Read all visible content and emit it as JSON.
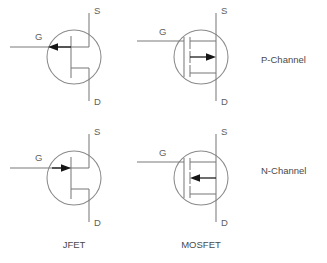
{
  "diagram": {
    "background_color": "#ffffff",
    "wire_color": "#7b7b7b",
    "arrow_color": "#151515",
    "text_color": "#4a4a4a",
    "columns": [
      {
        "key": "jfet",
        "label": "JFET"
      },
      {
        "key": "mosfet",
        "label": "MOSFET"
      }
    ],
    "rows": [
      {
        "key": "p_channel",
        "label": "P-Channel"
      },
      {
        "key": "n_channel",
        "label": "N-Channel"
      }
    ],
    "terminals": {
      "source": "S",
      "drain": "D",
      "gate": "G"
    },
    "symbols": [
      {
        "key": "p-channel-jfet",
        "device": "JFET",
        "channel": "P-Channel",
        "gate_arrow_direction": "left",
        "terminal_source": "S",
        "terminal_drain": "D",
        "terminal_gate": "G"
      },
      {
        "key": "p-channel-mosfet",
        "device": "MOSFET",
        "channel": "P-Channel",
        "gate_arrow_direction": "right",
        "terminal_source": "S",
        "terminal_drain": "D",
        "terminal_gate": "G"
      },
      {
        "key": "n-channel-jfet",
        "device": "JFET",
        "channel": "N-Channel",
        "gate_arrow_direction": "right",
        "terminal_source": "S",
        "terminal_drain": "D",
        "terminal_gate": "G"
      },
      {
        "key": "n-channel-mosfet",
        "device": "MOSFET",
        "channel": "N-Channel",
        "gate_arrow_direction": "left",
        "terminal_source": "S",
        "terminal_drain": "D",
        "terminal_gate": "G"
      }
    ]
  }
}
